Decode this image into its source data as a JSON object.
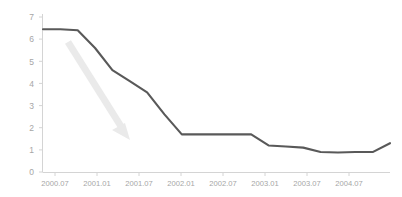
{
  "chart_data": {
    "type": "line",
    "title": "",
    "subtitle": "",
    "xlabel": "",
    "ylabel": "",
    "grid": false,
    "legend": null,
    "legend_position": "none",
    "line_color": "#595959",
    "axis_color": "#d4d4d4",
    "tick_label_color": "#a6a6a6",
    "annotation_color": "#eaeaea",
    "xlim_labels": [
      "2000.07",
      "2004.07"
    ],
    "ylim": [
      0,
      7
    ],
    "y_ticks": [
      "0",
      "1",
      "2",
      "3",
      "4",
      "5",
      "6",
      "7"
    ],
    "y_tick_values": [
      0,
      1,
      2,
      3,
      4,
      5,
      6,
      7
    ],
    "x_ticks": [
      "2000.07",
      "2001.01",
      "2001.07",
      "2002.01",
      "2002.07",
      "2003.01",
      "2003.07",
      "2004.07",
      "2004.07"
    ],
    "categories": [
      "2000.07",
      "2000.10",
      "2001.01",
      "2001.03",
      "2001.05",
      "2001.07",
      "2001.09",
      "2001.11",
      "2002.01",
      "2002.04",
      "2002.07",
      "2002.10",
      "2002.11",
      "2003.01",
      "2003.04",
      "2003.07",
      "2003.09",
      "2004.01",
      "2004.04",
      "2004.07",
      "2004.10"
    ],
    "values": [
      6.45,
      6.45,
      6.4,
      5.6,
      4.6,
      4.1,
      3.6,
      2.6,
      1.7,
      1.7,
      1.7,
      1.7,
      1.7,
      1.2,
      1.15,
      1.1,
      0.9,
      0.88,
      0.9,
      0.9,
      1.3
    ],
    "annotations": [
      {
        "type": "arrow",
        "label": "",
        "direction": "down-right",
        "color": "#eaeaea",
        "from": [
          68,
          42
        ],
        "to": [
          128,
          138
        ]
      }
    ]
  },
  "axes": {
    "y_axis_name": "value-axis",
    "x_axis_name": "time-axis"
  }
}
